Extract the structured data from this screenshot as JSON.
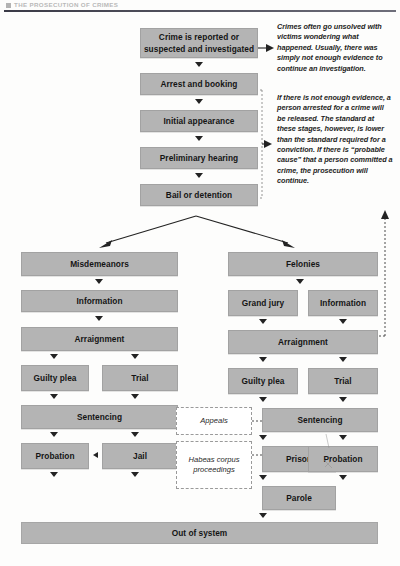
{
  "page": {
    "running_head": "THE PROSECUTION OF CRIMES"
  },
  "intake": {
    "steps": [
      {
        "label": "Crime is reported or suspected and investigated"
      },
      {
        "label": "Arrest and booking"
      },
      {
        "label": "Initial appearance"
      },
      {
        "label": "Preliminary hearing"
      },
      {
        "label": "Bail or detention"
      }
    ]
  },
  "notes": [
    {
      "id": "note-unsolved",
      "text": "Crimes often go unsolved with victims wondering what happened. Usually, there was simply not enough evidence to continue an investigation."
    },
    {
      "id": "note-probable-cause",
      "text": "If there is not enough evidence, a person arrested for a crime will be released. The standard at these stages, however, is lower than the standard required for a conviction. If there is “probable cause” that a person committed a crime, the prosecution will continue."
    }
  ],
  "branches": {
    "misdemeanor": {
      "heading": "Misdemeanors",
      "charging": "Information",
      "arraignment": "Arraignment",
      "plea": "Guilty plea",
      "trial": "Trial",
      "sentencing": "Sentencing",
      "probation": "Probation",
      "jail": "Jail"
    },
    "felony": {
      "heading": "Felonies",
      "grand_jury": "Grand jury",
      "information": "Information",
      "arraignment": "Arraignment",
      "plea": "Guilty plea",
      "trial": "Trial",
      "sentencing": "Sentencing",
      "prison": "Prison",
      "probation": "Probation",
      "parole": "Parole"
    }
  },
  "side_processes": [
    {
      "id": "appeals",
      "label": "Appeals"
    },
    {
      "id": "habeas",
      "label": "Habeas corpus proceedings"
    }
  ],
  "exit": {
    "label": "Out of system"
  },
  "colors": {
    "box_fill": "#b4b4b4",
    "box_border": "#a2a2a2",
    "text": "#141414",
    "arrow": "#232323",
    "dashed": "#9a9a9a",
    "rule": "#3a3a46"
  }
}
